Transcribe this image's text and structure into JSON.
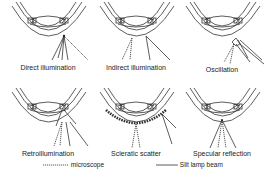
{
  "figure": {
    "panels": [
      {
        "id": "direct",
        "label": "Direct illumination"
      },
      {
        "id": "indirect",
        "label": "Indirect illumination"
      },
      {
        "id": "oscillation",
        "label": "Oscillation"
      },
      {
        "id": "retro",
        "label": "Retroillumination"
      },
      {
        "id": "scleratic",
        "label": "Scleratic scatter"
      },
      {
        "id": "specular",
        "label": "Specular reflection"
      }
    ],
    "legend": {
      "microscope": "microscope",
      "slit_lamp": "Slit lamp beam"
    },
    "colors": {
      "line": "#333333",
      "background": "#ffffff"
    }
  }
}
